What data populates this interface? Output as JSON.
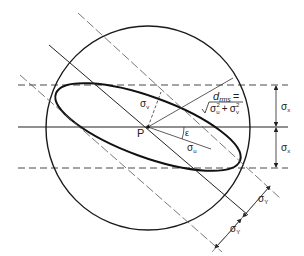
{
  "diagram": {
    "labels": {
      "point": "P",
      "sigma_v": "σ",
      "sigma_v_sub": "v",
      "sigma_u": "σ",
      "sigma_u_sub": "u",
      "epsilon": "ε",
      "drms_d": "d",
      "drms_sub": "rms",
      "drms_eq": "=",
      "sqrt_expr_1": "σ",
      "sqrt_expr_1_sub": "u",
      "sqrt_expr_1_sup": "2",
      "sqrt_plus": "+",
      "sqrt_expr_2": "σ",
      "sqrt_expr_2_sub": "v",
      "sqrt_expr_2_sup": "2",
      "sigma_x_top": "σ",
      "sigma_x_top_sub": "x",
      "sigma_x_bottom": "σ",
      "sigma_x_bottom_sub": "x",
      "sigma_y_upper": "σ",
      "sigma_y_upper_sub": "Y",
      "sigma_y_lower": "σ",
      "sigma_y_lower_sub": "Y"
    },
    "colors": {
      "stroke": "#1a1a1a",
      "thin": "#444444",
      "background": "#ffffff"
    }
  }
}
